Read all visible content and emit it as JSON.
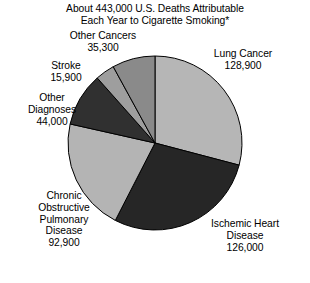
{
  "chart_data": {
    "type": "pie",
    "title": "About 443,000 U.S. Deaths Attributable\nEach Year to Cigarette Smoking*",
    "title_line1": "About 443,000 U.S. Deaths Attributable",
    "title_line2": "Each Year to Cigarette Smoking*",
    "total": 443000,
    "total_label": "443,000",
    "unit": "deaths per year",
    "legend": "none",
    "grid": false,
    "labels_position": "outside",
    "start_angle_deg": 0,
    "direction": "clockwise",
    "categories": [
      "Lung Cancer",
      "Ischemic Heart Disease",
      "Chronic Obstructive Pulmonary Disease",
      "Other Diagnoses",
      "Stroke",
      "Other Cancers"
    ],
    "values": [
      128900,
      126000,
      92900,
      44000,
      15900,
      35300
    ],
    "value_labels": [
      "128,900",
      "126,000",
      "92,900",
      "44,000",
      "15,900",
      "35,300"
    ],
    "colors": [
      "#b6b6b6",
      "#262626",
      "#b4b4b4",
      "#303030",
      "#9e9e9e",
      "#8a8a8a"
    ],
    "slices": [
      {
        "name": "Lung Cancer",
        "label_line1": "Lung Cancer",
        "value": 128900,
        "value_label": "128,900",
        "color": "#b6b6b6",
        "percent": 29.1
      },
      {
        "name": "Ischemic Heart Disease",
        "label_line1": "Ischemic Heart",
        "label_line2": "Disease",
        "value": 126000,
        "value_label": "126,000",
        "color": "#262626",
        "percent": 28.4
      },
      {
        "name": "Chronic Obstructive Pulmonary Disease",
        "label_line1": "Chronic",
        "label_line2": "Obstructive",
        "label_line3": "Pulmonary",
        "label_line4": "Disease",
        "value": 92900,
        "value_label": "92,900",
        "color": "#b4b4b4",
        "percent": 21.0
      },
      {
        "name": "Other Diagnoses",
        "label_line1": "Other",
        "label_line2": "Diagnoses",
        "value": 44000,
        "value_label": "44,000",
        "color": "#303030",
        "percent": 9.9
      },
      {
        "name": "Stroke",
        "label_line1": "Stroke",
        "value": 15900,
        "value_label": "15,900",
        "color": "#9e9e9e",
        "percent": 3.6
      },
      {
        "name": "Other Cancers",
        "label_line1": "Other Cancers",
        "value": 35300,
        "value_label": "35,300",
        "color": "#8a8a8a",
        "percent": 8.0
      }
    ],
    "geometry": {
      "cx": 155,
      "cy": 143,
      "r": 87,
      "stroke": "#000000",
      "stroke_width": 1
    }
  },
  "labels": {
    "other_cancers": "Other Cancers\n35,300",
    "lung_cancer": "Lung Cancer\n128,900",
    "stroke": "Stroke\n15,900",
    "other_diagnoses": "Other\nDiagnoses\n44,000",
    "copd": "Chronic\nObstructive\nPulmonary\nDisease\n92,900",
    "ischemic": "Ischemic Heart\nDisease\n126,000"
  }
}
